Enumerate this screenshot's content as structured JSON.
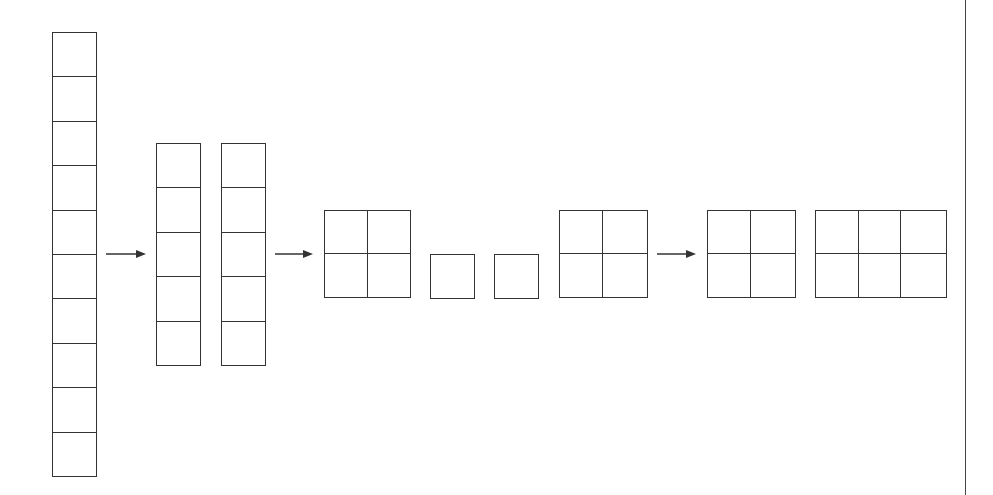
{
  "diagram": {
    "stroke_color": "#333333",
    "background_color": "#ffffff",
    "elements": [
      {
        "id": "column-10",
        "type": "column",
        "cells": 10,
        "x": 52,
        "y": 32,
        "cell_w": 44,
        "cell_h": 44.4
      },
      {
        "id": "arrow-1",
        "type": "arrow",
        "x1": 106,
        "x2": 145,
        "y": 254
      },
      {
        "id": "column-5-a",
        "type": "column",
        "cells": 5,
        "x": 156,
        "y": 143,
        "cell_w": 44,
        "cell_h": 44.4
      },
      {
        "id": "column-5-b",
        "type": "column",
        "cells": 5,
        "x": 221,
        "y": 143,
        "cell_w": 44,
        "cell_h": 44.4
      },
      {
        "id": "arrow-2",
        "type": "arrow",
        "x1": 275,
        "x2": 313,
        "y": 254
      },
      {
        "id": "grid-2x2-a",
        "type": "grid",
        "rows": 2,
        "cols": 2,
        "x": 324,
        "y": 210
      },
      {
        "id": "square-a",
        "type": "grid",
        "rows": 1,
        "cols": 1,
        "x": 430,
        "y": 254
      },
      {
        "id": "square-b",
        "type": "grid",
        "rows": 1,
        "cols": 1,
        "x": 494,
        "y": 254
      },
      {
        "id": "grid-2x2-b",
        "type": "grid",
        "rows": 2,
        "cols": 2,
        "x": 559,
        "y": 210
      },
      {
        "id": "arrow-3",
        "type": "arrow",
        "x1": 657,
        "x2": 696,
        "y": 254
      },
      {
        "id": "grid-2x2-c",
        "type": "grid",
        "rows": 2,
        "cols": 2,
        "x": 707,
        "y": 210
      },
      {
        "id": "grid-2x3",
        "type": "grid",
        "rows": 2,
        "cols": 3,
        "x": 815,
        "y": 210
      }
    ],
    "divider": {
      "x": 965
    }
  }
}
